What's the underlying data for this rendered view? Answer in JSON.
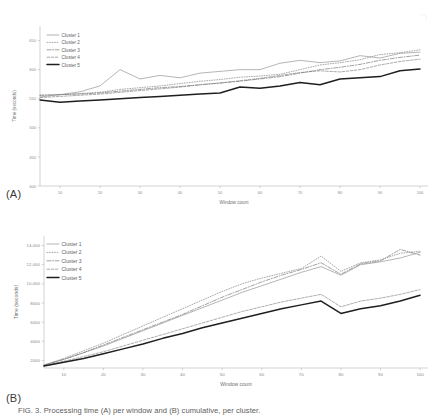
{
  "figure": {
    "panel_a_label": "(A)",
    "panel_b_label": "(B)",
    "caption": "FIG. 3.  Processing time (A) per window and (B) cumulative, per cluster."
  },
  "chart_data": [
    {
      "id": "chart-a",
      "type": "line",
      "title": "",
      "xlabel": "Window count",
      "ylabel": "Time (seconds)",
      "xlim": [
        5,
        102
      ],
      "ylim": [
        400,
        675
      ],
      "xticks": [
        10,
        20,
        30,
        40,
        50,
        60,
        70,
        80,
        90,
        100
      ],
      "yticks": [
        400,
        450,
        500,
        550,
        600,
        650
      ],
      "ytick_labels": [
        "400",
        "450",
        "500",
        "550",
        "600",
        "650"
      ],
      "grid": false,
      "legend_position": "top-left",
      "x": [
        5,
        10,
        15,
        20,
        25,
        30,
        35,
        40,
        45,
        50,
        55,
        60,
        65,
        70,
        75,
        80,
        85,
        90,
        95,
        100
      ],
      "series": [
        {
          "name": "Cluster 1",
          "style": "solid-thin",
          "color": "#8c8c8c",
          "values": [
            553,
            557,
            562,
            572,
            600,
            584,
            590,
            586,
            594,
            597,
            600,
            600,
            611,
            616,
            612,
            615,
            624,
            620,
            628,
            630
          ]
        },
        {
          "name": "Cluster 2",
          "style": "dotted",
          "color": "#7a7a7a",
          "values": [
            556,
            557,
            559,
            561,
            566,
            569,
            572,
            576,
            580,
            583,
            587,
            589,
            592,
            600,
            608,
            612,
            617,
            626,
            629,
            634
          ]
        },
        {
          "name": "Cluster 3",
          "style": "dash-dot",
          "color": "#6f6f6f",
          "values": [
            556,
            557,
            558,
            560,
            563,
            566,
            569,
            571,
            574,
            577,
            580,
            584,
            588,
            594,
            600,
            604,
            609,
            616,
            621,
            625
          ]
        },
        {
          "name": "Cluster 4",
          "style": "dashed",
          "color": "#7f7f7f",
          "values": [
            552,
            554,
            556,
            558,
            561,
            564,
            567,
            570,
            574,
            577,
            581,
            585,
            590,
            595,
            598,
            596,
            600,
            608,
            614,
            618
          ]
        },
        {
          "name": "Cluster 5",
          "style": "solid-bold",
          "color": "#1f1f1f",
          "values": [
            548,
            544,
            546,
            548,
            550,
            552,
            554,
            556,
            558,
            560,
            570,
            568,
            572,
            578,
            574,
            584,
            586,
            588,
            598,
            601
          ]
        }
      ]
    },
    {
      "id": "chart-b",
      "type": "line",
      "title": "",
      "xlabel": "Window count",
      "ylabel": "Time (seconds)",
      "xlim": [
        5,
        102
      ],
      "ylim": [
        1200,
        15000
      ],
      "xticks": [
        10,
        20,
        30,
        40,
        50,
        60,
        70,
        80,
        90,
        100
      ],
      "yticks": [
        2000,
        4000,
        6000,
        8000,
        10000,
        12000,
        14000
      ],
      "ytick_labels": [
        "2000",
        "4000",
        "6000",
        "8000",
        "10,000",
        "12,000",
        "14,000"
      ],
      "grid": false,
      "legend_position": "top-left",
      "x": [
        5,
        10,
        15,
        20,
        25,
        30,
        35,
        40,
        45,
        50,
        55,
        60,
        65,
        70,
        75,
        80,
        85,
        90,
        95,
        100
      ],
      "series": [
        {
          "name": "Cluster 1",
          "style": "solid-thin",
          "color": "#8c8c8c",
          "values": [
            1500,
            2100,
            2800,
            3500,
            4300,
            5100,
            5900,
            6700,
            7500,
            8300,
            9100,
            9800,
            10500,
            11200,
            11800,
            10900,
            12000,
            12300,
            12700,
            13300
          ]
        },
        {
          "name": "Cluster 2",
          "style": "dotted",
          "color": "#7a7a7a",
          "values": [
            1500,
            2200,
            3000,
            3800,
            4700,
            5600,
            6500,
            7400,
            8300,
            9200,
            10000,
            10600,
            11100,
            11600,
            12900,
            11300,
            12200,
            12500,
            13200,
            13400
          ]
        },
        {
          "name": "Cluster 3",
          "style": "dash-dot",
          "color": "#6f6f6f",
          "values": [
            1500,
            2100,
            2800,
            3600,
            4400,
            5200,
            6000,
            6800,
            7700,
            8600,
            9400,
            10200,
            10900,
            11500,
            12200,
            11000,
            12100,
            12400,
            13600,
            13000
          ]
        },
        {
          "name": "Cluster 4",
          "style": "dashed",
          "color": "#7f7f7f",
          "values": [
            1450,
            1900,
            2400,
            2900,
            3500,
            4100,
            4700,
            5300,
            5900,
            6500,
            7100,
            7600,
            8100,
            8500,
            8900,
            7600,
            8200,
            8500,
            8900,
            9400
          ]
        },
        {
          "name": "Cluster 5",
          "style": "solid-bold",
          "color": "#1f1f1f",
          "values": [
            1400,
            1800,
            2200,
            2700,
            3200,
            3700,
            4300,
            4800,
            5400,
            5900,
            6400,
            6900,
            7400,
            7800,
            8200,
            6900,
            7400,
            7700,
            8200,
            8800
          ]
        }
      ]
    }
  ]
}
